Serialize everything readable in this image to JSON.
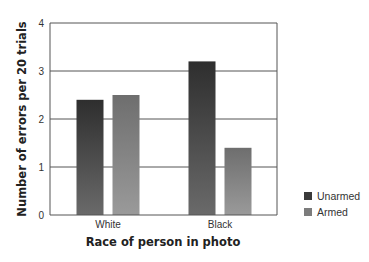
{
  "chart_data": {
    "type": "bar",
    "title": "",
    "xlabel": "Race of person in photo",
    "ylabel": "Number of errors per 20 trials",
    "categories": [
      "White",
      "Black"
    ],
    "series": [
      {
        "name": "Unarmed",
        "values": [
          2.4,
          3.2
        ],
        "color": "#3a3a3a"
      },
      {
        "name": "Armed",
        "values": [
          2.5,
          1.4
        ],
        "color": "#7a7a7a"
      }
    ],
    "ylim": [
      0,
      4
    ],
    "yticks": [
      "0",
      "1",
      "2",
      "3",
      "4"
    ],
    "grid": true,
    "legend_position": "right-bottom"
  }
}
